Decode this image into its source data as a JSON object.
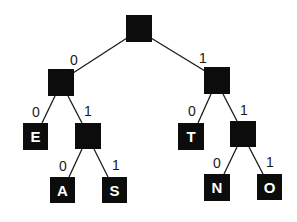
{
  "diagram": {
    "type": "binary-code-tree",
    "colors": {
      "node": "#0c0c0c",
      "leaf_text": "#ffffff",
      "edge": "#1a1a1a",
      "background": "#ffffff"
    },
    "nodes": [
      {
        "id": "root",
        "label": "",
        "x": 126,
        "y": 15,
        "w": 26,
        "h": 27
      },
      {
        "id": "n0",
        "label": "",
        "x": 48,
        "y": 69,
        "w": 26,
        "h": 27
      },
      {
        "id": "n1",
        "label": "",
        "x": 204,
        "y": 67,
        "w": 26,
        "h": 27
      },
      {
        "id": "leaf-e",
        "label": "E",
        "x": 23,
        "y": 123,
        "w": 25,
        "h": 27
      },
      {
        "id": "n01",
        "label": "",
        "x": 75,
        "y": 123,
        "w": 26,
        "h": 26
      },
      {
        "id": "leaf-a",
        "label": "A",
        "x": 50,
        "y": 177,
        "w": 25,
        "h": 26
      },
      {
        "id": "leaf-s",
        "label": "S",
        "x": 102,
        "y": 177,
        "w": 25,
        "h": 26
      },
      {
        "id": "leaf-t",
        "label": "T",
        "x": 178,
        "y": 123,
        "w": 26,
        "h": 27
      },
      {
        "id": "n11",
        "label": "",
        "x": 230,
        "y": 121,
        "w": 26,
        "h": 26
      },
      {
        "id": "leaf-n",
        "label": "N",
        "x": 204,
        "y": 174,
        "w": 26,
        "h": 27
      },
      {
        "id": "leaf-o",
        "label": "O",
        "x": 257,
        "y": 174,
        "w": 25,
        "h": 26
      }
    ],
    "edges": [
      {
        "from": "root",
        "to": "n0",
        "label": "0",
        "x1": 127,
        "y1": 38,
        "x2": 73,
        "y2": 73,
        "lx": 70,
        "ly": 53
      },
      {
        "from": "root",
        "to": "n1",
        "label": "1",
        "x1": 151,
        "y1": 38,
        "x2": 205,
        "y2": 71,
        "lx": 199,
        "ly": 51
      },
      {
        "from": "n0",
        "to": "leaf-e",
        "label": "0",
        "x1": 55,
        "y1": 96,
        "x2": 42,
        "y2": 123,
        "lx": 32,
        "ly": 105
      },
      {
        "from": "n0",
        "to": "n01",
        "label": "1",
        "x1": 68,
        "y1": 96,
        "x2": 82,
        "y2": 123,
        "lx": 84,
        "ly": 104
      },
      {
        "from": "n01",
        "to": "leaf-a",
        "label": "0",
        "x1": 82,
        "y1": 149,
        "x2": 69,
        "y2": 177,
        "lx": 59,
        "ly": 159
      },
      {
        "from": "n01",
        "to": "leaf-s",
        "label": "1",
        "x1": 94,
        "y1": 149,
        "x2": 108,
        "y2": 177,
        "lx": 112,
        "ly": 158
      },
      {
        "from": "n1",
        "to": "leaf-t",
        "label": "0",
        "x1": 211,
        "y1": 94,
        "x2": 198,
        "y2": 123,
        "lx": 188,
        "ly": 104
      },
      {
        "from": "n1",
        "to": "n11",
        "label": "1",
        "x1": 223,
        "y1": 94,
        "x2": 237,
        "y2": 121,
        "lx": 240,
        "ly": 103
      },
      {
        "from": "n11",
        "to": "leaf-n",
        "label": "0",
        "x1": 237,
        "y1": 147,
        "x2": 224,
        "y2": 174,
        "lx": 213,
        "ly": 156
      },
      {
        "from": "n11",
        "to": "leaf-o",
        "label": "1",
        "x1": 249,
        "y1": 147,
        "x2": 263,
        "y2": 174,
        "lx": 266,
        "ly": 155
      }
    ]
  }
}
